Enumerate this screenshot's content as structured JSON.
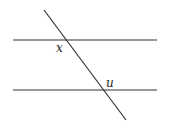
{
  "diagram": {
    "type": "parallel-lines-transversal",
    "labels": {
      "angle_top": "x",
      "angle_bottom": "u"
    },
    "colors": {
      "line": "#333333",
      "background": "#ffffff"
    }
  }
}
